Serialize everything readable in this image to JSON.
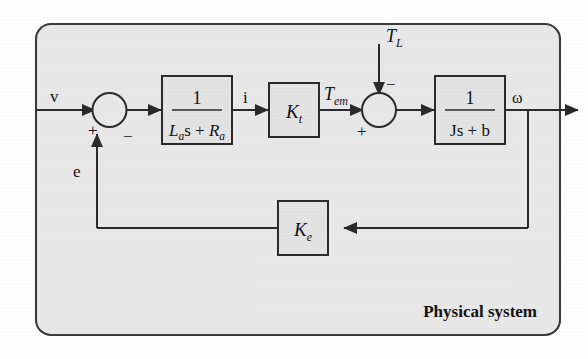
{
  "figure": {
    "container_label": "Physical system",
    "panel_fill": "#e9e9e9",
    "panel_stroke": "#3c3c3c",
    "block_fill": "#e4e4e4",
    "line_color": "#2b2b2b"
  },
  "signals": {
    "input_voltage": "v",
    "back_emf": "e",
    "current": "i",
    "em_torque_base": "T",
    "em_torque_sub": "em",
    "load_torque_base": "T",
    "load_torque_sub": "L",
    "output_speed": "ω"
  },
  "blocks": [
    {
      "name": "armature-electrical",
      "numerator": "1",
      "denominator_parts": [
        {
          "text": "L",
          "style": "italic"
        },
        {
          "text": "a",
          "style": "italic-sub"
        },
        {
          "text": "s",
          "style": "upright"
        },
        {
          "text": " + ",
          "style": "upright"
        },
        {
          "text": "R",
          "style": "italic"
        },
        {
          "text": "a",
          "style": "italic-sub"
        }
      ],
      "denominator_plain": "La s + Ra"
    },
    {
      "name": "torque-constant",
      "gain_base": "K",
      "gain_sub": "t"
    },
    {
      "name": "mechanical-load",
      "numerator": "1",
      "denominator_parts": [
        {
          "text": "J",
          "style": "upright"
        },
        {
          "text": "s",
          "style": "upright"
        },
        {
          "text": " + ",
          "style": "upright"
        },
        {
          "text": "b",
          "style": "upright"
        }
      ],
      "denominator_plain": "Js + b"
    },
    {
      "name": "back-emf-constant",
      "gain_base": "K",
      "gain_sub": "e"
    }
  ],
  "summing_junctions": [
    {
      "name": "voltage-summer",
      "signs": {
        "input": "+",
        "feedback": "−"
      }
    },
    {
      "name": "torque-summer",
      "signs": {
        "input": "+",
        "disturbance": "−"
      }
    }
  ]
}
